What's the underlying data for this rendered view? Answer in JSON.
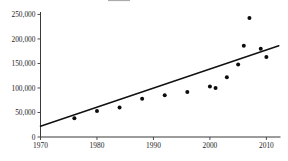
{
  "chart_data": {
    "type": "scatter",
    "title": "",
    "subtitle": "",
    "xlabel": "",
    "ylabel": "",
    "xlim": [
      1970,
      2012.5
    ],
    "ylim": [
      0,
      255000
    ],
    "grid": false,
    "legend": null,
    "x_ticks": [
      1970,
      1980,
      1990,
      2000,
      2010
    ],
    "x_tick_labels": [
      "1970",
      "1980",
      "1990",
      "2000",
      "2010"
    ],
    "y_ticks": [
      0,
      50000,
      100000,
      150000,
      200000,
      250000
    ],
    "y_tick_labels": [
      "0",
      "50,000",
      "100,000",
      "150,000",
      "200,000",
      "250,000"
    ],
    "series": [
      {
        "name": "observations",
        "type": "scatter",
        "marker": "filled-circle",
        "color": "#0d0d0d",
        "points": [
          {
            "x": 1976,
            "y": 38000
          },
          {
            "x": 1980,
            "y": 53000
          },
          {
            "x": 1984,
            "y": 60000
          },
          {
            "x": 1988,
            "y": 78000
          },
          {
            "x": 1992,
            "y": 85000
          },
          {
            "x": 1996,
            "y": 92000
          },
          {
            "x": 2000,
            "y": 103000
          },
          {
            "x": 2001,
            "y": 100000
          },
          {
            "x": 2003,
            "y": 122000
          },
          {
            "x": 2005,
            "y": 148000
          },
          {
            "x": 2006,
            "y": 186000
          },
          {
            "x": 2007,
            "y": 243000
          },
          {
            "x": 2009,
            "y": 180000
          },
          {
            "x": 2010,
            "y": 163000
          }
        ]
      },
      {
        "name": "trend-line",
        "type": "line",
        "color": "#111111",
        "points": [
          {
            "x": 1970,
            "y": 22000
          },
          {
            "x": 2012.2,
            "y": 186000
          }
        ]
      }
    ]
  },
  "axes": {
    "y_axis_name": "value-axis",
    "x_axis_name": "year-axis"
  }
}
